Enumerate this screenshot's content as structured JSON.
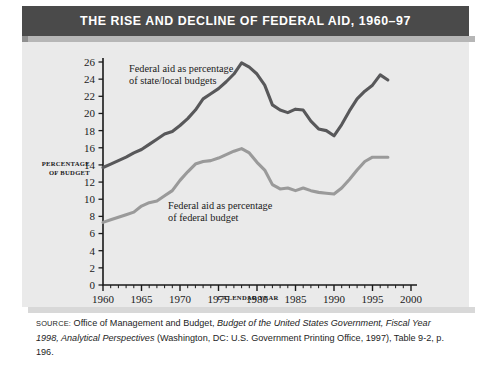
{
  "figure": {
    "title": "THE RISE AND DECLINE OF FEDERAL AID, 1960–97",
    "source_kicker": "SOURCE:",
    "source_part1": " Office of Management and Budget, ",
    "source_italic1": "Budget of the United States Government, Fiscal Year 1998, Analytical Perspectives",
    "source_part2": " (Washington, DC: U.S. Government Printing Office, 1997), Table 9-2, p. 196."
  },
  "colors": {
    "title_bar": "#4a4a4a",
    "panel": "#eaeaea",
    "series_state_local": "#58585a",
    "series_federal": "#9a9a9a",
    "axis": "#1a1a1a"
  },
  "chart_data": {
    "type": "line",
    "title": "THE RISE AND DECLINE OF FEDERAL AID, 1960–97",
    "xlabel": "CALENDAR YEAR",
    "ylabel": "PERCENTAGE OF BUDGET",
    "xlim": [
      1960,
      2000
    ],
    "ylim": [
      0,
      26
    ],
    "xticks": [
      1960,
      1965,
      1970,
      1975,
      1980,
      1985,
      1990,
      1995,
      2000
    ],
    "yticks": [
      0,
      2,
      4,
      6,
      8,
      10,
      12,
      14,
      16,
      18,
      20,
      22,
      24,
      26
    ],
    "minor_xtick_step": 1,
    "grid": false,
    "legend": "inline-annotations",
    "annotations": [
      {
        "text_line1": "Federal aid as percentage",
        "text_line2": "of state/local budgets",
        "series": "state_local"
      },
      {
        "text_line1": "Federal aid as percentage",
        "text_line2": "of federal budget",
        "series": "federal"
      }
    ],
    "x": [
      1960,
      1961,
      1962,
      1963,
      1964,
      1965,
      1966,
      1967,
      1968,
      1969,
      1970,
      1971,
      1972,
      1973,
      1974,
      1975,
      1976,
      1977,
      1978,
      1979,
      1980,
      1981,
      1982,
      1983,
      1984,
      1985,
      1986,
      1987,
      1988,
      1989,
      1990,
      1991,
      1992,
      1993,
      1994,
      1995,
      1996,
      1997
    ],
    "series": [
      {
        "name": "Federal aid as percentage of state/local budgets",
        "color": "#58585a",
        "values": [
          13.7,
          14.1,
          14.5,
          14.9,
          15.4,
          15.8,
          16.4,
          17.0,
          17.6,
          17.9,
          18.6,
          19.4,
          20.4,
          21.7,
          22.3,
          22.9,
          23.7,
          24.6,
          25.9,
          25.4,
          24.6,
          23.3,
          21.0,
          20.4,
          20.1,
          20.5,
          20.4,
          19.1,
          18.2,
          18.0,
          17.4,
          18.7,
          20.3,
          21.7,
          22.6,
          23.3,
          24.5,
          23.9
        ]
      },
      {
        "name": "Federal aid as percentage of federal budget",
        "color": "#9a9a9a",
        "values": [
          7.3,
          7.6,
          7.9,
          8.2,
          8.5,
          9.2,
          9.6,
          9.8,
          10.4,
          11.0,
          12.2,
          13.2,
          14.1,
          14.4,
          14.5,
          14.8,
          15.2,
          15.6,
          15.9,
          15.4,
          14.3,
          13.4,
          11.7,
          11.2,
          11.3,
          11.0,
          11.3,
          11.0,
          10.8,
          10.7,
          10.6,
          11.3,
          12.3,
          13.4,
          14.4,
          14.9,
          14.9,
          14.9
        ]
      }
    ]
  }
}
